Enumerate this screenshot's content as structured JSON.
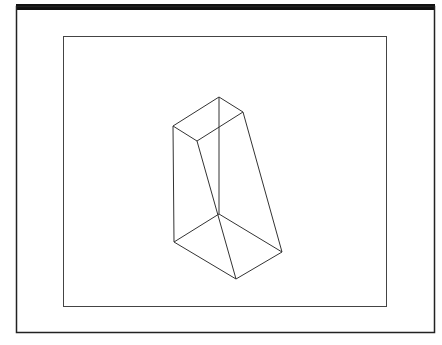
{
  "figure": {
    "colors": {
      "background": "#ffffff",
      "frame": "#222222",
      "title_bar": "#111111",
      "viewport": "#444444",
      "edges": "#333333"
    },
    "shape": {
      "vertices": {
        "top_back": [
          219,
          97
        ],
        "top_right": [
          243,
          112
        ],
        "top_left": [
          173,
          126
        ],
        "top_front": [
          197,
          141
        ],
        "bottom_back": [
          219,
          214
        ],
        "bottom_right": [
          282,
          252
        ],
        "bottom_front": [
          236,
          279
        ],
        "bottom_left": [
          174,
          242
        ]
      }
    }
  }
}
